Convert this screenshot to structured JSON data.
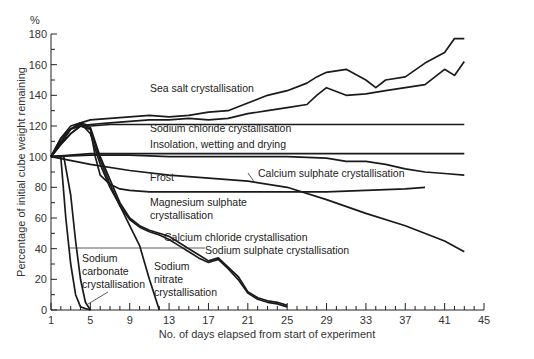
{
  "chart_data": {
    "type": "line",
    "title": "",
    "xlabel": "No. of days elapsed from start of experiment",
    "ylabel": "Percentage of initial cube weight remaining",
    "y_unit": "%",
    "xlim": [
      1,
      45
    ],
    "ylim": [
      0,
      180
    ],
    "x_ticks": [
      1,
      5,
      9,
      13,
      17,
      21,
      25,
      29,
      33,
      37,
      41,
      45
    ],
    "y_ticks": [
      0,
      20,
      40,
      60,
      80,
      100,
      120,
      140,
      160,
      180
    ],
    "grid": false,
    "legend": "inline labels",
    "series": [
      {
        "name": "Sea salt crystallisation (upper)",
        "x": [
          1,
          2,
          3,
          4,
          5,
          7,
          9,
          11,
          13,
          15,
          17,
          19,
          21,
          23,
          25,
          27,
          28,
          29,
          31,
          33,
          34,
          35,
          37,
          39,
          41,
          42,
          43
        ],
        "values": [
          100,
          110,
          118,
          122,
          124,
          125,
          126,
          127,
          126,
          127,
          129,
          130,
          135,
          140,
          143,
          148,
          152,
          155,
          157,
          150,
          145,
          150,
          152,
          161,
          168,
          177,
          177
        ]
      },
      {
        "name": "Sea salt crystallisation (lower)",
        "x": [
          1,
          2,
          3,
          4,
          5,
          7,
          9,
          11,
          13,
          15,
          17,
          19,
          21,
          23,
          25,
          27,
          28,
          29,
          31,
          33,
          35,
          37,
          39,
          41,
          42,
          43
        ],
        "values": [
          100,
          108,
          115,
          120,
          121,
          122,
          123,
          124,
          124,
          125,
          124,
          125,
          128,
          130,
          132,
          134,
          140,
          145,
          140,
          141,
          143,
          145,
          147,
          157,
          153,
          162
        ]
      },
      {
        "name": "Sodium chloride crystallisation",
        "x": [
          1,
          2,
          3,
          4,
          5,
          7,
          9,
          11,
          13,
          15,
          17,
          19,
          21,
          23,
          25,
          27,
          29,
          31,
          33,
          35,
          37,
          39,
          41,
          43
        ],
        "values": [
          100,
          112,
          118,
          122,
          120,
          121,
          121,
          121,
          121,
          121,
          121,
          121,
          121,
          121,
          121,
          121,
          121,
          121,
          121,
          121,
          121,
          121,
          121,
          121
        ]
      },
      {
        "name": "Insolation, wetting and drying",
        "x": [
          1,
          5,
          9,
          13,
          17,
          21,
          25,
          29,
          33,
          37,
          41,
          43
        ],
        "values": [
          100,
          102,
          102,
          102,
          102,
          102,
          102,
          102,
          102,
          102,
          102,
          102
        ]
      },
      {
        "name": "Calcium sulphate crystallisation",
        "x": [
          1,
          5,
          9,
          13,
          17,
          21,
          25,
          29,
          31,
          33,
          35,
          37,
          39,
          41,
          43
        ],
        "values": [
          100,
          101,
          101,
          100,
          100,
          100,
          100,
          99,
          97,
          97,
          95,
          92,
          90,
          89,
          88
        ]
      },
      {
        "name": "Frost",
        "x": [
          1,
          5,
          9,
          13,
          17,
          21,
          25,
          29,
          33,
          37,
          41,
          43
        ],
        "values": [
          100,
          95,
          91,
          88,
          86,
          84,
          80,
          72,
          63,
          55,
          45,
          38
        ]
      },
      {
        "name": "Magnesium sulphate crystallisation",
        "x": [
          1,
          2,
          3,
          4,
          5,
          5.5,
          6,
          7,
          8,
          9,
          11,
          13,
          15,
          17,
          21,
          25,
          29,
          33,
          37,
          39
        ],
        "values": [
          100,
          108,
          115,
          120,
          118,
          100,
          88,
          82,
          79,
          78,
          77,
          77,
          77,
          77,
          77,
          77,
          77,
          78,
          79,
          80
        ]
      },
      {
        "name": "Calcium chloride crystallisation",
        "x": [
          1,
          3,
          4,
          5,
          6,
          7,
          8,
          9,
          10,
          11,
          12,
          13,
          14,
          15,
          16,
          17,
          18,
          19,
          20,
          21,
          22,
          23,
          24,
          25
        ],
        "values": [
          100,
          118,
          121,
          119,
          100,
          85,
          70,
          60,
          55,
          52,
          50,
          48,
          44,
          40,
          36,
          32,
          34,
          28,
          22,
          12,
          8,
          6,
          5,
          3
        ]
      },
      {
        "name": "Sodium sulphate crystallisation",
        "x": [
          1,
          3,
          4,
          5,
          6,
          7,
          8,
          9,
          10,
          11,
          12,
          13,
          14,
          15,
          16,
          17,
          18,
          19,
          20,
          21,
          22,
          23,
          24,
          25
        ],
        "values": [
          100,
          118,
          120,
          118,
          98,
          82,
          68,
          59,
          54,
          51,
          49,
          46,
          42,
          38,
          34,
          31,
          33,
          27,
          20,
          11,
          7,
          5,
          4,
          2
        ]
      },
      {
        "name": "Sodium nitrate crystallisation",
        "x": [
          1,
          2,
          3,
          4,
          5,
          6,
          7,
          8,
          9,
          10,
          11,
          12
        ],
        "values": [
          100,
          112,
          120,
          122,
          115,
          95,
          80,
          68,
          55,
          42,
          20,
          0
        ]
      },
      {
        "name": "Sodium carbonate crystallisation (a)",
        "x": [
          1,
          2,
          2.5,
          3,
          3.5,
          4,
          4.5,
          5
        ],
        "values": [
          100,
          100,
          60,
          30,
          10,
          2,
          1,
          0
        ]
      },
      {
        "name": "Sodium carbonate crystallisation (b)",
        "x": [
          1,
          2.3,
          3,
          3.5,
          4,
          4.5,
          5
        ],
        "values": [
          100,
          100,
          75,
          45,
          20,
          5,
          0
        ]
      }
    ],
    "annotations": [
      {
        "text": "Sea salt crystallisation",
        "x": 11.5,
        "y": 137
      },
      {
        "text": "Sodium chloride crystallisation",
        "x": 11.5,
        "y": 114
      },
      {
        "text": "Insolation, wetting and drying",
        "x": 11.5,
        "y": 105
      },
      {
        "text": "Calcium sulphate crystallisation",
        "x": 22,
        "y": 90
      },
      {
        "text": "Frost",
        "x": 11.5,
        "y": 85
      },
      {
        "text": "Magnesium sulphate crystallisation",
        "x": 11.5,
        "y": 71
      },
      {
        "text": "Calcium chloride crystallisation",
        "x": 14,
        "y": 46
      },
      {
        "text": "Sodium sulphate crystallisation",
        "x": 18,
        "y": 41
      },
      {
        "text": "Sodium nitrate crystallisation",
        "x": 13.5,
        "y": 31
      },
      {
        "text": "Sodium carbonate crystallisation",
        "x": 4,
        "y": 37
      }
    ]
  },
  "labels": {
    "y_unit": "%",
    "ylabel": "Percentage of initial cube weight remaining",
    "xlabel": "No. of days elapsed from start of experiment",
    "sea_salt": "Sea salt crystallisation",
    "sodium_chloride": "Sodium chloride crystallisation",
    "insolation": "Insolation, wetting and drying",
    "calcium_sulphate": "Calcium sulphate crystallisation",
    "frost": "Frost",
    "magnesium_sulphate_1": "Magnesium sulphate",
    "magnesium_sulphate_2": "crystallisation",
    "calcium_chloride": "Calcium chloride crystallisation",
    "sodium_sulphate": "Sodium sulphate crystallisation",
    "sodium_nitrate_1": "Sodium",
    "sodium_nitrate_2": "nitrate",
    "sodium_nitrate_3": "crystallisation",
    "sodium_carbonate_1": "Sodium",
    "sodium_carbonate_2": "carbonate",
    "sodium_carbonate_3": "crystallisation"
  }
}
